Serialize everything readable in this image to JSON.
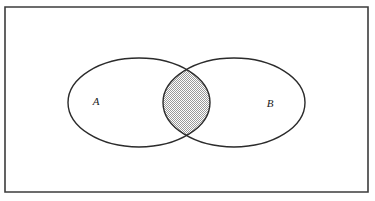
{
  "figure": {
    "kind": "venn-diagram",
    "caption": "",
    "background_color": "#ffffff",
    "frame": {
      "name": "universal-set-rectangle",
      "x": 5,
      "y": 7,
      "width": 363,
      "height": 185,
      "stroke_color": "#3c3c3c",
      "stroke_width": 1.6,
      "fill_color": "#ffffff"
    },
    "sets": [
      {
        "id": "A",
        "label": "A",
        "label_x": 96,
        "label_y": 105,
        "ellipse": {
          "cx": 139,
          "cy": 102.5,
          "rx": 71,
          "ry": 44.5
        },
        "stroke_color": "#2b2b2b",
        "stroke_width": 1.4,
        "fill_color": "#ffffff"
      },
      {
        "id": "B",
        "label": "B",
        "label_x": 270,
        "label_y": 107,
        "ellipse": {
          "cx": 234,
          "cy": 102.5,
          "rx": 71,
          "ry": 44.5
        },
        "stroke_color": "#2b2b2b",
        "stroke_width": 1.4,
        "fill_color": "#ffffff"
      }
    ],
    "intersection": {
      "name": "A-intersect-B",
      "shaded": true,
      "shading_style": "checkerboard-dither-50",
      "shading_color": "#9a9a9a",
      "shading_base_color": "#ffffff",
      "left_x": 163,
      "right_x": 210,
      "top_y": 68,
      "bottom_y": 137
    }
  }
}
